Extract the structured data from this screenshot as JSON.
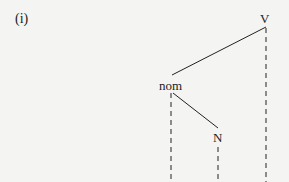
{
  "example_label": "(i)",
  "tree": {
    "nodes": [
      {
        "id": "V",
        "label": "V"
      },
      {
        "id": "nom",
        "label": "nom"
      },
      {
        "id": "N",
        "label": "N"
      }
    ],
    "edges": [
      {
        "from": "V",
        "to": "nom",
        "style": "solid"
      },
      {
        "from": "nom",
        "to": "N",
        "style": "solid"
      }
    ],
    "dashed_projections": [
      "nom",
      "N",
      "V"
    ]
  }
}
